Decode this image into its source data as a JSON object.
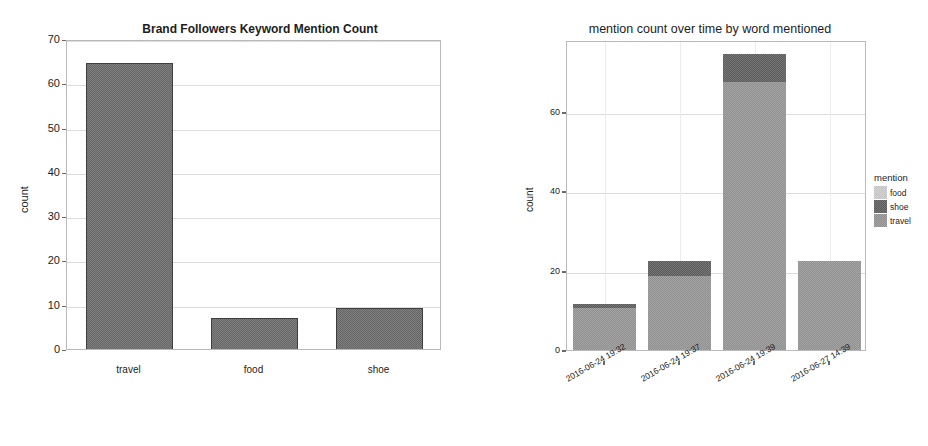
{
  "chart_data": [
    {
      "id": "brand-followers-keyword-mention-count",
      "type": "bar",
      "title": "Brand Followers Keyword Mention Count",
      "xlabel": "",
      "ylabel": "count",
      "categories": [
        "travel",
        "food",
        "shoe"
      ],
      "values": [
        65,
        7.4,
        9.6
      ],
      "ylim": [
        0,
        70
      ],
      "yticks": [
        0,
        10,
        20,
        30,
        40,
        50,
        60,
        70
      ],
      "ytick_labels": [
        "0",
        "10",
        "20",
        "30",
        "40",
        "50",
        "60",
        "70"
      ],
      "grid": true,
      "legend": false,
      "bar_color": "#666666"
    },
    {
      "id": "mention-count-over-time-by-word-mentioned",
      "type": "bar",
      "subtype": "stacked",
      "title": "mention count over time by word mentioned",
      "xlabel": "",
      "ylabel": "count",
      "categories": [
        "2016-06-24 19:32",
        "2016-06-24 19:37",
        "2016-06-24 19:39",
        "2016-06-27 14:39"
      ],
      "series": [
        {
          "name": "food",
          "values": [
            0,
            0,
            0,
            0
          ],
          "color": "#c6c6c6"
        },
        {
          "name": "shoe",
          "values": [
            1,
            4,
            7,
            0
          ],
          "color": "#5d5d5d"
        },
        {
          "name": "travel",
          "values": [
            11,
            19,
            68,
            23
          ],
          "color": "#909090"
        }
      ],
      "totals": [
        12,
        23,
        75,
        23
      ],
      "ylim": [
        0,
        78
      ],
      "yticks": [
        0,
        20,
        40,
        60
      ],
      "ytick_labels": [
        "0",
        "20",
        "40",
        "60"
      ],
      "grid": true,
      "legend": {
        "title": "mention",
        "position": "right",
        "entries": [
          "food",
          "shoe",
          "travel"
        ]
      }
    }
  ]
}
